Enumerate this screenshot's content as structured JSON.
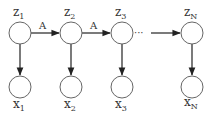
{
  "diagram": {
    "type": "hidden-markov-model",
    "latent_nodes": [
      {
        "id": "z1",
        "base": "z",
        "sub": "1",
        "cx": 20,
        "cy": 33
      },
      {
        "id": "z2",
        "base": "z",
        "sub": "2",
        "cx": 71,
        "cy": 33
      },
      {
        "id": "z3",
        "base": "z",
        "sub": "3",
        "cx": 122,
        "cy": 33
      },
      {
        "id": "zN",
        "base": "z",
        "sub": "N",
        "cx": 192,
        "cy": 33
      }
    ],
    "observed_nodes": [
      {
        "id": "x1",
        "base": "x",
        "sub": "1",
        "cx": 20,
        "cy": 87
      },
      {
        "id": "x2",
        "base": "x",
        "sub": "2",
        "cx": 71,
        "cy": 87
      },
      {
        "id": "x3",
        "base": "x",
        "sub": "3",
        "cx": 122,
        "cy": 87
      },
      {
        "id": "xN",
        "base": "x",
        "sub": "N",
        "cx": 192,
        "cy": 87
      }
    ],
    "transition_edges": [
      {
        "from": "z1",
        "to": "z2",
        "label": "A"
      },
      {
        "from": "z2",
        "to": "z3",
        "label": "A"
      },
      {
        "from": "z3",
        "to": "zN",
        "label": "",
        "style": "ellipsis-then-arrow"
      }
    ],
    "emission_edges": [
      {
        "from": "z1",
        "to": "x1"
      },
      {
        "from": "z2",
        "to": "x2"
      },
      {
        "from": "z3",
        "to": "x3"
      },
      {
        "from": "zN",
        "to": "xN"
      }
    ],
    "ellipsis": "···",
    "colors": {
      "node_stroke": "#666666",
      "edge": "#222222",
      "text": "#333333"
    }
  }
}
